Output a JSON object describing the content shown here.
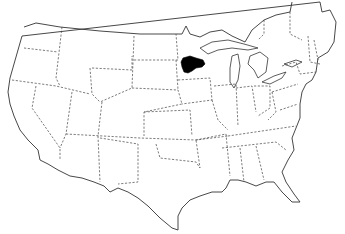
{
  "map": {
    "subject": "Contiguous United States outline map with dashed state borders",
    "width": 345,
    "height": 234,
    "background_color": "#ffffff",
    "line_color": "#333333",
    "highlighted_region": {
      "label": "Shaded region near western Lake Superior (northeastern Minnesota / northwestern Wisconsin)",
      "fill_color": "#000000",
      "approx_bbox": [
        180,
        55,
        205,
        73
      ]
    }
  }
}
